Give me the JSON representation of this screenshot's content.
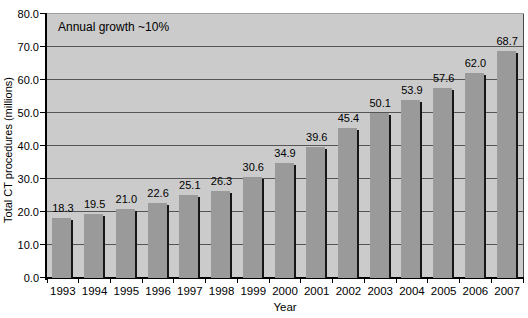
{
  "chart_data": {
    "type": "bar",
    "annotation": "Annual growth ~10%",
    "xlabel": "Year",
    "ylabel": "Total CT procedures (millions)",
    "categories": [
      "1993",
      "1994",
      "1995",
      "1996",
      "1997",
      "1998",
      "1999",
      "2000",
      "2001",
      "2002",
      "2003",
      "2004",
      "2005",
      "2006",
      "2007"
    ],
    "values": [
      18.3,
      19.5,
      21.0,
      22.6,
      25.1,
      26.3,
      30.6,
      34.9,
      39.6,
      45.4,
      50.1,
      53.9,
      57.6,
      62.0,
      68.7
    ],
    "value_labels": [
      "18.3",
      "19.5",
      "21.0",
      "22.6",
      "25.1",
      "26.3",
      "30.6",
      "34.9",
      "39.6",
      "45.4",
      "50.1",
      "53.9",
      "57.6",
      "62.0",
      "68.7"
    ],
    "ylim": [
      0,
      80
    ],
    "ytick_step": 10,
    "yticks": [
      "0.0",
      "10.0",
      "20.0",
      "30.0",
      "40.0",
      "50.0",
      "60.0",
      "70.0",
      "80.0"
    ],
    "grid": true,
    "legend": "none",
    "colors": {
      "page_bg": "#ffffff",
      "plot_bg": "#cbcbcb",
      "bar": "#9a9a9a",
      "bar_shadow": "#161616",
      "gridline": "#555555",
      "axis": "#000000",
      "text": "#000000"
    }
  }
}
